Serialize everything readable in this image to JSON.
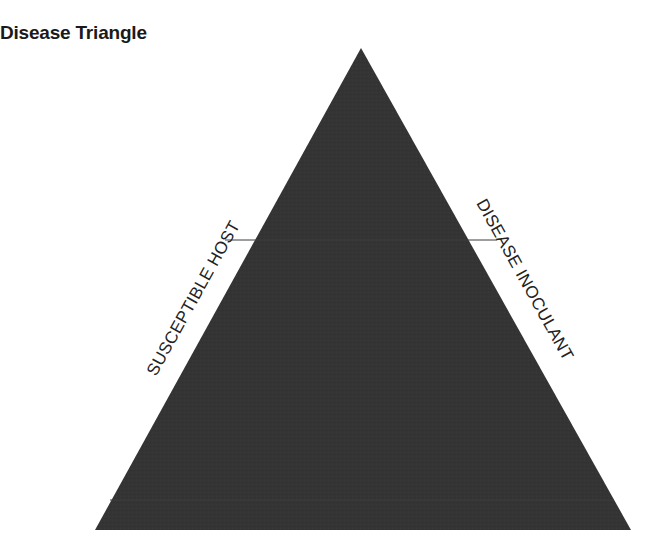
{
  "title": "Disease Triangle",
  "triangle": {
    "fill": "#333333",
    "apex": [
      361,
      48
    ],
    "bottom_left": [
      95,
      530
    ],
    "bottom_right": [
      631,
      530
    ]
  },
  "labels": {
    "left_side": "SUSCEPTIBLE HOST",
    "right_side": "DISEASE INOCULANT"
  }
}
